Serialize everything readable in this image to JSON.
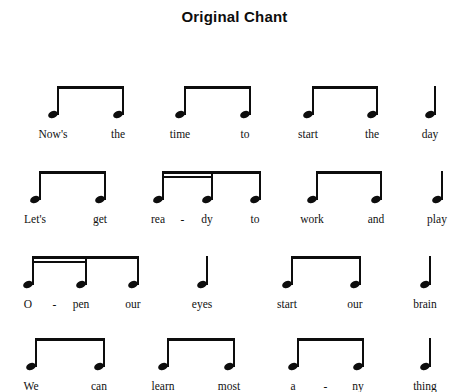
{
  "document": {
    "title": "Original Chant",
    "type": "rhythm-chant-notation",
    "ink_color": "#0d0d0d",
    "background_color": "#ffffff"
  },
  "staff": {
    "rows": [
      {
        "row_index": 1,
        "baseline_y": 74,
        "lyric_y": 88,
        "groups": [
          {
            "name": "group-1",
            "beam": "eighth-pair",
            "notes": [
              {
                "x": 53,
                "value": "eighth",
                "lyric": "Now's"
              },
              {
                "x": 118,
                "value": "eighth",
                "lyric": "the"
              }
            ],
            "hyphen_after": []
          },
          {
            "name": "group-2",
            "beam": "eighth-pair",
            "notes": [
              {
                "x": 180,
                "value": "eighth",
                "lyric": "time"
              },
              {
                "x": 245,
                "value": "eighth",
                "lyric": "to"
              }
            ],
            "hyphen_after": []
          },
          {
            "name": "group-3",
            "beam": "eighth-pair",
            "notes": [
              {
                "x": 308,
                "value": "eighth",
                "lyric": "start"
              },
              {
                "x": 372,
                "value": "eighth",
                "lyric": "the"
              }
            ],
            "hyphen_after": []
          },
          {
            "name": "group-4",
            "beam": "none",
            "notes": [
              {
                "x": 430,
                "value": "quarter",
                "lyric": "day"
              }
            ],
            "hyphen_after": []
          }
        ]
      },
      {
        "row_index": 2,
        "baseline_y": 74,
        "lyric_y": 88,
        "groups": [
          {
            "name": "group-1",
            "beam": "eighth-pair",
            "notes": [
              {
                "x": 35,
                "value": "eighth",
                "lyric": "Let's"
              },
              {
                "x": 100,
                "value": "eighth",
                "lyric": "get"
              }
            ],
            "hyphen_after": []
          },
          {
            "name": "group-2",
            "beam": "sixteenth-pair-plus-eighth",
            "notes": [
              {
                "x": 158,
                "value": "sixteenth",
                "lyric": "rea"
              },
              {
                "x": 207,
                "value": "sixteenth",
                "lyric": "dy"
              },
              {
                "x": 255,
                "value": "eighth",
                "lyric": "to"
              }
            ],
            "hyphen_after": [
              0
            ]
          },
          {
            "name": "group-3",
            "beam": "eighth-pair",
            "notes": [
              {
                "x": 312,
                "value": "eighth",
                "lyric": "work"
              },
              {
                "x": 376,
                "value": "eighth",
                "lyric": "and"
              }
            ],
            "hyphen_after": []
          },
          {
            "name": "group-4",
            "beam": "none",
            "notes": [
              {
                "x": 437,
                "value": "quarter",
                "lyric": "play"
              }
            ],
            "hyphen_after": []
          }
        ]
      },
      {
        "row_index": 3,
        "baseline_y": 74,
        "lyric_y": 88,
        "groups": [
          {
            "name": "group-1",
            "beam": "sixteenth-pair-plus-eighth",
            "notes": [
              {
                "x": 28,
                "value": "sixteenth",
                "lyric": "O"
              },
              {
                "x": 81,
                "value": "sixteenth",
                "lyric": "pen"
              },
              {
                "x": 133,
                "value": "eighth",
                "lyric": "our"
              }
            ],
            "hyphen_after": [
              0
            ]
          },
          {
            "name": "group-2",
            "beam": "none",
            "notes": [
              {
                "x": 202,
                "value": "quarter",
                "lyric": "eyes"
              }
            ],
            "hyphen_after": []
          },
          {
            "name": "group-3",
            "beam": "eighth-pair",
            "notes": [
              {
                "x": 287,
                "value": "eighth",
                "lyric": "start"
              },
              {
                "x": 355,
                "value": "eighth",
                "lyric": "our"
              }
            ],
            "hyphen_after": []
          },
          {
            "name": "group-4",
            "beam": "none",
            "notes": [
              {
                "x": 425,
                "value": "quarter",
                "lyric": "brain"
              }
            ],
            "hyphen_after": []
          }
        ]
      },
      {
        "row_index": 4,
        "baseline_y": 74,
        "lyric_y": 88,
        "groups": [
          {
            "name": "group-1",
            "beam": "eighth-pair",
            "notes": [
              {
                "x": 31,
                "value": "eighth",
                "lyric": "We"
              },
              {
                "x": 99,
                "value": "eighth",
                "lyric": "can"
              }
            ],
            "hyphen_after": []
          },
          {
            "name": "group-2",
            "beam": "eighth-pair",
            "notes": [
              {
                "x": 163,
                "value": "eighth",
                "lyric": "learn"
              },
              {
                "x": 229,
                "value": "eighth",
                "lyric": "most"
              }
            ],
            "hyphen_after": []
          },
          {
            "name": "group-3",
            "beam": "eighth-pair",
            "notes": [
              {
                "x": 293,
                "value": "eighth",
                "lyric": "a"
              },
              {
                "x": 358,
                "value": "eighth",
                "lyric": "ny"
              }
            ],
            "hyphen_after": [
              0
            ]
          },
          {
            "name": "group-4",
            "beam": "none",
            "notes": [
              {
                "x": 425,
                "value": "quarter",
                "lyric": "thing"
              }
            ],
            "hyphen_after": []
          }
        ]
      }
    ],
    "row_tops": [
      40,
      125,
      210,
      292
    ],
    "hyphen_glyph": "-"
  },
  "lyrics_full_text": [
    "Now's the time to start the day",
    "Let's get rea - dy to work and play",
    "O - pen our eyes start our brain",
    "We can learn most a - ny thing"
  ]
}
